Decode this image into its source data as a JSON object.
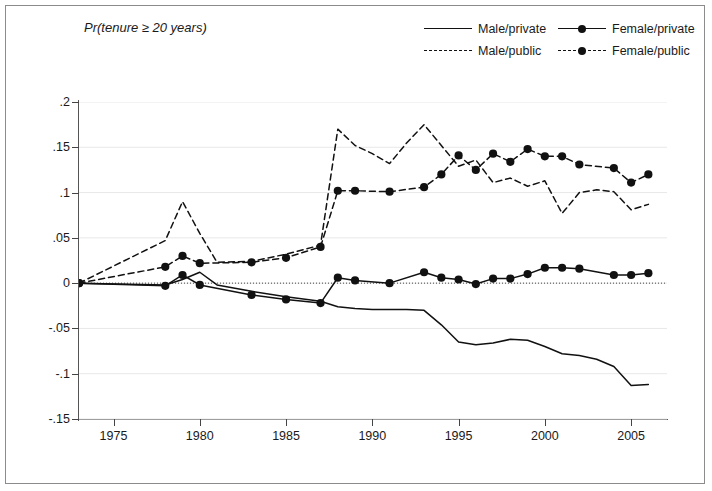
{
  "chart_data": {
    "type": "line",
    "title": "Pr(tenure ≥ 20 years)",
    "xlabel": "",
    "ylabel": "",
    "xlim": [
      1973,
      2006.5
    ],
    "ylim": [
      -0.15,
      0.2
    ],
    "grid": true,
    "legend_position": "top-right",
    "yticks": [
      0.2,
      0.15,
      0.1,
      0.05,
      0,
      -0.05,
      -0.1,
      -0.15
    ],
    "ytick_labels": [
      ".2",
      ".15",
      ".1",
      ".05",
      "0",
      "-.05",
      "-.1",
      "-.15"
    ],
    "xticks": [
      1975,
      1980,
      1985,
      1990,
      1995,
      2000,
      2005
    ],
    "xtick_labels": [
      "1975",
      "1980",
      "1985",
      "1990",
      "1995",
      "2000",
      "2005"
    ],
    "zero_reference_line": 0,
    "series": [
      {
        "name": "Male/private",
        "style": "solid",
        "markers": false,
        "x": [
          1973,
          1978,
          1979,
          1980,
          1981,
          1983,
          1985,
          1987,
          1988,
          1989,
          1990,
          1991,
          1992,
          1993,
          1994,
          1995,
          1996,
          1997,
          1998,
          1999,
          2000,
          2001,
          2002,
          2003,
          2004,
          2005,
          2006
        ],
        "values": [
          0,
          -0.002,
          0.004,
          0.012,
          -0.002,
          -0.009,
          -0.015,
          -0.02,
          -0.026,
          -0.028,
          -0.029,
          -0.029,
          -0.029,
          -0.03,
          -0.046,
          -0.065,
          -0.068,
          -0.066,
          -0.062,
          -0.063,
          -0.07,
          -0.078,
          -0.08,
          -0.084,
          -0.092,
          -0.113,
          -0.112
        ]
      },
      {
        "name": "Male/public",
        "style": "dashed",
        "markers": false,
        "x": [
          1973,
          1978,
          1979,
          1980,
          1981,
          1983,
          1985,
          1987,
          1988,
          1989,
          1990,
          1991,
          1992,
          1993,
          1994,
          1995,
          1996,
          1997,
          1998,
          1999,
          2000,
          2001,
          2002,
          2003,
          2004,
          2005,
          2006
        ],
        "values": [
          0,
          0.047,
          0.09,
          0.055,
          0.023,
          0.024,
          0.032,
          0.042,
          0.17,
          0.152,
          0.143,
          0.132,
          0.155,
          0.175,
          0.152,
          0.129,
          0.136,
          0.111,
          0.116,
          0.107,
          0.113,
          0.077,
          0.1,
          0.103,
          0.101,
          0.081,
          0.087
        ]
      },
      {
        "name": "Female/private",
        "style": "solid",
        "markers": true,
        "x": [
          1973,
          1978,
          1979,
          1980,
          1983,
          1985,
          1987,
          1988,
          1989,
          1991,
          1993,
          1994,
          1995,
          1996,
          1997,
          1998,
          1999,
          2000,
          2001,
          2002,
          2004,
          2005,
          2006
        ],
        "values": [
          0,
          -0.003,
          0.009,
          -0.002,
          -0.013,
          -0.018,
          -0.022,
          0.006,
          0.003,
          0.0,
          0.012,
          0.006,
          0.004,
          -0.001,
          0.005,
          0.005,
          0.01,
          0.017,
          0.017,
          0.016,
          0.009,
          0.009,
          0.011
        ]
      },
      {
        "name": "Female/public",
        "style": "dashed",
        "markers": true,
        "x": [
          1973,
          1978,
          1979,
          1980,
          1983,
          1985,
          1987,
          1988,
          1989,
          1991,
          1993,
          1994,
          1995,
          1996,
          1997,
          1998,
          1999,
          2000,
          2001,
          2002,
          2004,
          2005,
          2006
        ],
        "values": [
          0,
          0.018,
          0.03,
          0.022,
          0.023,
          0.028,
          0.04,
          0.102,
          0.102,
          0.101,
          0.106,
          0.12,
          0.141,
          0.125,
          0.143,
          0.134,
          0.148,
          0.14,
          0.14,
          0.131,
          0.127,
          0.111,
          0.12
        ]
      }
    ]
  },
  "legend": {
    "items": [
      {
        "label": "Male/private"
      },
      {
        "label": "Female/private"
      },
      {
        "label": "Male/public"
      },
      {
        "label": "Female/public"
      }
    ]
  },
  "colors": {
    "line": "#111111",
    "axis": "#555555",
    "grid": "#e8e8e8",
    "frame": "#8c8c8c"
  }
}
